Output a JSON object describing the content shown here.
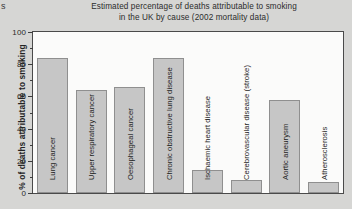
{
  "stray_text": "s",
  "chart_data": {
    "type": "bar",
    "title_line1": "Estimated percentage of deaths attributable to smoking",
    "title_line2": "in the UK by cause (2002 mortality data)",
    "title": "Estimated percentage of deaths attributable to smoking in the UK by cause (2002 mortality data)",
    "xlabel": "",
    "ylabel": "% of deaths attributable to smoking",
    "ylim": [
      0,
      100
    ],
    "ytick_labels": [
      "0",
      "20",
      "40",
      "60",
      "80",
      "100"
    ],
    "ytick_values": [
      0,
      20,
      40,
      60,
      80,
      100
    ],
    "yminor_values": [
      10,
      30,
      50,
      70,
      90
    ],
    "grid": false,
    "legend": "none",
    "bar_color": "#c6c6c6",
    "bar_edge_color": "#8f8f8f",
    "plot_background": "#fbfbfa",
    "page_background": "#d6d6d4",
    "categories": [
      "Lung cancer",
      "Upper respiratory cancer",
      "Oesophageal cancer",
      "Chronic obstructive lung disease",
      "Ischaemic heart disease",
      "Cerebrovascular disease (stroke)",
      "Aortic aneurysm",
      "Atherosclerosis"
    ],
    "values": [
      84,
      64,
      66,
      84,
      14,
      8,
      58,
      7
    ]
  }
}
